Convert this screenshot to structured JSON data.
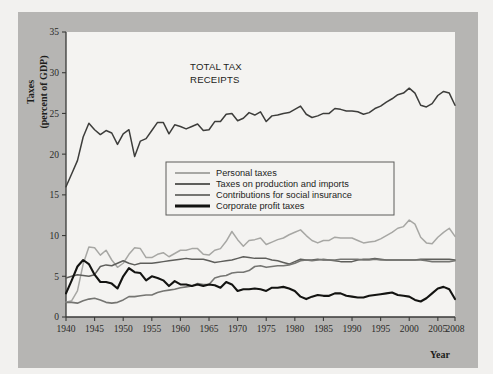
{
  "chart_data": {
    "type": "line",
    "title": "",
    "annotation": "TOTAL TAX RECEIPTS",
    "annotation_lines": [
      "TOTAL TAX",
      "RECEIPTS"
    ],
    "xlabel": "Year",
    "ylabel": "Taxes (percent of GDP)",
    "ylabel_lines": [
      "Taxes",
      "(percent of GDP)"
    ],
    "xlim": [
      1940,
      2008
    ],
    "ylim": [
      0,
      35
    ],
    "xticks": [
      1940,
      1945,
      1950,
      1955,
      1960,
      1965,
      1970,
      1975,
      1980,
      1985,
      1990,
      1995,
      2000,
      2005,
      2008
    ],
    "xticklabels": [
      "1940",
      "1945",
      "1950",
      "1955",
      "1960",
      "1965",
      "1970",
      "1975",
      "1980",
      "1985",
      "1990",
      "1995",
      "2000",
      "2005",
      "2008"
    ],
    "yticks": [
      0,
      5,
      10,
      15,
      20,
      25,
      30,
      35
    ],
    "yticklabels": [
      "0",
      "5",
      "10",
      "15",
      "20",
      "25",
      "30",
      "35"
    ],
    "grid": false,
    "legend_position": "center",
    "x": [
      1940,
      1941,
      1942,
      1943,
      1944,
      1945,
      1946,
      1947,
      1948,
      1949,
      1950,
      1951,
      1952,
      1953,
      1954,
      1955,
      1956,
      1957,
      1958,
      1959,
      1960,
      1961,
      1962,
      1963,
      1964,
      1965,
      1966,
      1967,
      1968,
      1969,
      1970,
      1971,
      1972,
      1973,
      1974,
      1975,
      1976,
      1977,
      1978,
      1979,
      1980,
      1981,
      1982,
      1983,
      1984,
      1985,
      1986,
      1987,
      1988,
      1989,
      1990,
      1991,
      1992,
      1993,
      1994,
      1995,
      1996,
      1997,
      1998,
      1999,
      2000,
      2001,
      2002,
      2003,
      2004,
      2005,
      2006,
      2007,
      2008
    ],
    "series": [
      {
        "name": "Total tax receipts",
        "color": "#3d3d3b",
        "width": 1.5,
        "values": [
          16.0,
          17.6,
          19.2,
          22.1,
          23.8,
          23.0,
          22.4,
          22.9,
          22.6,
          21.2,
          22.5,
          23.0,
          19.7,
          21.6,
          21.9,
          22.9,
          23.9,
          23.9,
          22.5,
          23.6,
          23.4,
          23.1,
          23.4,
          23.7,
          22.9,
          23.0,
          24.0,
          24.0,
          24.9,
          25.0,
          24.1,
          24.4,
          25.1,
          24.8,
          25.2,
          24.0,
          24.7,
          24.8,
          25.0,
          25.1,
          25.5,
          25.9,
          24.9,
          24.5,
          24.7,
          25.0,
          25.0,
          25.6,
          25.5,
          25.3,
          25.3,
          25.2,
          24.9,
          25.1,
          25.6,
          25.9,
          26.4,
          26.8,
          27.3,
          27.5,
          28.1,
          27.5,
          26.0,
          25.8,
          26.2,
          27.2,
          27.7,
          27.5,
          26.0
        ]
      },
      {
        "name": "Personal taxes",
        "color": "#a7a7a4",
        "width": 1.5,
        "values": [
          1.8,
          2.0,
          3.2,
          6.5,
          8.6,
          8.5,
          7.6,
          8.2,
          7.0,
          6.1,
          6.6,
          7.7,
          8.5,
          8.4,
          7.3,
          7.3,
          7.7,
          7.9,
          7.4,
          7.8,
          8.2,
          8.2,
          8.4,
          8.4,
          7.7,
          7.6,
          8.2,
          8.4,
          9.3,
          10.5,
          9.5,
          8.7,
          9.4,
          9.5,
          9.7,
          8.9,
          9.2,
          9.5,
          9.7,
          10.1,
          10.4,
          10.7,
          10.0,
          9.4,
          9.1,
          9.4,
          9.4,
          9.8,
          9.7,
          9.7,
          9.7,
          9.4,
          9.1,
          9.2,
          9.3,
          9.6,
          10.0,
          10.4,
          10.9,
          11.1,
          11.9,
          11.4,
          9.8,
          9.1,
          9.0,
          9.8,
          10.4,
          10.9,
          9.9
        ]
      },
      {
        "name": "Taxes on production and imports",
        "color": "#5e5e5b",
        "width": 1.5,
        "values": [
          4.8,
          5.0,
          5.2,
          5.1,
          5.0,
          5.2,
          6.2,
          6.4,
          6.3,
          6.6,
          6.9,
          6.6,
          6.4,
          6.6,
          6.6,
          6.6,
          6.7,
          6.8,
          6.9,
          7.0,
          7.1,
          7.2,
          7.1,
          7.1,
          7.1,
          6.9,
          6.7,
          6.8,
          6.9,
          7.0,
          7.2,
          7.4,
          7.3,
          7.2,
          7.2,
          7.2,
          7.0,
          6.9,
          6.7,
          6.5,
          6.8,
          7.1,
          7.0,
          7.0,
          7.1,
          7.0,
          7.0,
          6.9,
          6.8,
          6.8,
          6.8,
          7.0,
          7.1,
          7.1,
          7.2,
          7.1,
          7.0,
          7.0,
          7.0,
          7.0,
          7.0,
          7.0,
          7.1,
          7.1,
          7.1,
          7.1,
          7.1,
          7.1,
          7.0
        ]
      },
      {
        "name": "Contributions for social insurance",
        "color": "#757572",
        "width": 1.6,
        "values": [
          1.8,
          1.8,
          1.7,
          2.0,
          2.2,
          2.3,
          2.1,
          1.8,
          1.7,
          1.8,
          2.1,
          2.5,
          2.5,
          2.6,
          2.7,
          2.7,
          3.0,
          3.2,
          3.3,
          3.4,
          3.6,
          3.7,
          3.8,
          4.1,
          4.0,
          4.0,
          4.8,
          5.0,
          5.1,
          5.4,
          5.5,
          5.5,
          5.7,
          6.2,
          6.3,
          6.1,
          6.2,
          6.3,
          6.3,
          6.4,
          6.6,
          6.9,
          7.0,
          6.9,
          7.0,
          7.1,
          7.0,
          7.0,
          7.1,
          7.1,
          7.1,
          7.1,
          7.0,
          7.0,
          7.1,
          7.0,
          7.0,
          7.0,
          7.0,
          7.0,
          7.0,
          7.0,
          7.0,
          6.9,
          6.8,
          6.8,
          6.8,
          6.8,
          6.9
        ]
      },
      {
        "name": "Corporate profit taxes",
        "color": "#131311",
        "width": 2.1,
        "values": [
          2.9,
          4.5,
          6.2,
          7.0,
          6.5,
          5.2,
          4.3,
          4.3,
          4.1,
          3.5,
          5.0,
          6.0,
          5.5,
          5.4,
          4.5,
          5.0,
          4.8,
          4.5,
          3.8,
          4.4,
          4.0,
          4.0,
          3.8,
          4.0,
          3.8,
          4.0,
          3.9,
          3.6,
          4.3,
          4.0,
          3.2,
          3.4,
          3.4,
          3.5,
          3.4,
          3.2,
          3.6,
          3.6,
          3.7,
          3.5,
          3.2,
          2.5,
          2.2,
          2.5,
          2.7,
          2.6,
          2.6,
          2.9,
          2.9,
          2.6,
          2.5,
          2.4,
          2.4,
          2.6,
          2.7,
          2.8,
          2.9,
          3.0,
          2.7,
          2.6,
          2.5,
          2.1,
          1.9,
          2.3,
          2.9,
          3.5,
          3.7,
          3.4,
          2.2
        ]
      }
    ],
    "legend": [
      {
        "label": "Personal taxes",
        "color": "#a7a7a4",
        "width": 1.8
      },
      {
        "label": "Taxes on production and imports",
        "color": "#5e5e5b",
        "width": 2.0
      },
      {
        "label": "Contributions for social insurance",
        "color": "#757572",
        "width": 2.2
      },
      {
        "label": "Corporate profit taxes",
        "color": "#131311",
        "width": 2.8
      }
    ]
  }
}
